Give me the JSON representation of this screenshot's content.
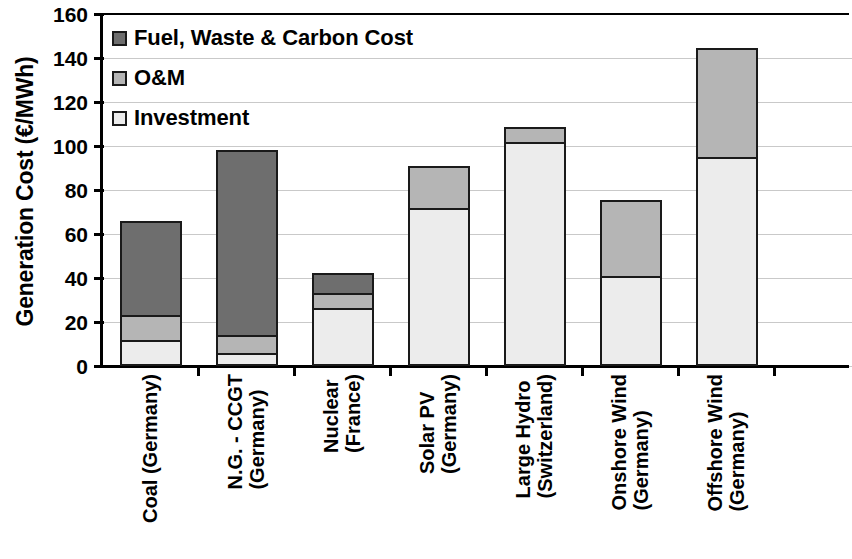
{
  "chart_data": {
    "type": "bar",
    "subtype": "stacked-column",
    "title": "",
    "xlabel": "",
    "ylabel": "Generation Cost (€/MWh)",
    "ylim": [
      0,
      160
    ],
    "ytick_step": 20,
    "yticks": [
      "160",
      "140",
      "120",
      "100",
      "80",
      "60",
      "40",
      "20",
      "0"
    ],
    "grid": "horizontal",
    "legend_position": "inside-top-left",
    "categories": [
      "Coal (Germany)",
      "N.G. - CCGT (Germany)",
      "Nuclear (France)",
      "Solar PV (Germany)",
      "Large Hydro (Switzerland)",
      "Onshore Wind (Germany)",
      "Offshore Wind (Germany)"
    ],
    "category_lines": [
      {
        "l1": "Coal (Germany)",
        "l2": ""
      },
      {
        "l1": "N.G. - CCGT",
        "l2": "(Germany)"
      },
      {
        "l1": "Nuclear",
        "l2": "(France)"
      },
      {
        "l1": "Solar PV",
        "l2": "(Germany)"
      },
      {
        "l1": "Large Hydro",
        "l2": "(Switzerland)"
      },
      {
        "l1": "Onshore Wind",
        "l2": "(Germany)"
      },
      {
        "l1": "Offshore Wind",
        "l2": "(Germany)"
      }
    ],
    "series": [
      {
        "name": "Investment",
        "color": "#ececec",
        "values": [
          12,
          6,
          26.5,
          72,
          102,
          41,
          95
        ]
      },
      {
        "name": "O&M",
        "color": "#b5b5b5",
        "values": [
          11,
          8,
          6.5,
          19,
          6.5,
          34.5,
          49.5
        ]
      },
      {
        "name": "Fuel, Waste & Carbon Cost",
        "color": "#6e6e6e",
        "values": [
          43,
          84,
          9.5,
          0,
          0,
          0,
          0
        ]
      }
    ],
    "totals": [
      66,
      98,
      42.5,
      91,
      108.5,
      75.5,
      144.5
    ]
  },
  "legend": {
    "items": [
      {
        "label": "Fuel, Waste & Carbon Cost",
        "swatch": "fuel"
      },
      {
        "label": "O&M",
        "swatch": "om"
      },
      {
        "label": "Investment",
        "swatch": "invest"
      }
    ]
  },
  "axes": {
    "y_title": "Generation Cost (€/MWh)"
  },
  "colors": {
    "fuel": "#6e6e6e",
    "om": "#b5b5b5",
    "investment": "#ececec",
    "axis": "#000000",
    "gridline": "#c9c9c9"
  }
}
